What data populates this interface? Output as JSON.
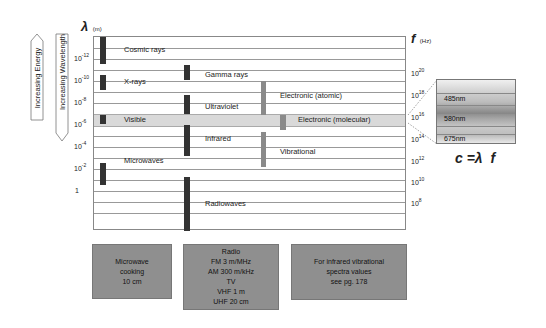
{
  "left_axis": {
    "symbol": "λ",
    "unit": "(m)",
    "ticks": [
      {
        "base": "10",
        "exp": "-12"
      },
      {
        "base": "10",
        "exp": "-10"
      },
      {
        "base": "10",
        "exp": "-8"
      },
      {
        "base": "10",
        "exp": "-6"
      },
      {
        "base": "10",
        "exp": "-4"
      },
      {
        "base": "10",
        "exp": "-2"
      },
      {
        "base": "1",
        "exp": ""
      }
    ]
  },
  "right_axis": {
    "symbol": "f",
    "unit": "(Hz)",
    "ticks": [
      {
        "base": "10",
        "exp": "20"
      },
      {
        "base": "10",
        "exp": "18"
      },
      {
        "base": "10",
        "exp": "16"
      },
      {
        "base": "10",
        "exp": "14"
      },
      {
        "base": "10",
        "exp": "12"
      },
      {
        "base": "10",
        "exp": "10"
      },
      {
        "base": "10",
        "exp": "8"
      }
    ]
  },
  "arrows": {
    "energy": "Increasing Energy",
    "wavelength": "Increasing Wavelength"
  },
  "regions": {
    "cosmic": "Cosmic rays",
    "xrays": "X-rays",
    "visible": "Visible",
    "microwaves": "Microwaves",
    "gamma": "Gamma rays",
    "ultraviolet": "Ultraviolet",
    "infrared": "Infrared",
    "radiowaves": "Radiowaves",
    "electronic_atomic": "Electronic (atomic)",
    "electronic_molecular": "Electronic (molecular)",
    "vibrational": "Vibrational"
  },
  "spectrum": {
    "bands": [
      "485nm",
      "580nm",
      "675nm"
    ]
  },
  "equation": "c =λ  f",
  "notes": {
    "microwave": [
      "Microwave",
      "cooking",
      "10 cm"
    ],
    "radio": [
      "Radio",
      "FM 3 m/MHz",
      "AM 300 m/kHz",
      "TV",
      "VHF 1 m",
      "UHF 20 cm"
    ],
    "infrared": [
      "For infrared vibrational",
      "spectra values",
      "see pg. 178"
    ]
  },
  "colors": {
    "bar_dark": "#333333",
    "bar_gray": "#8a8a8a",
    "visible_band": "#d9d9d9",
    "note_box": "#8f8f8f"
  }
}
